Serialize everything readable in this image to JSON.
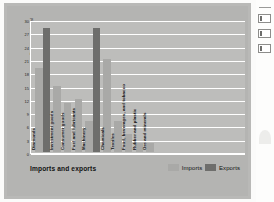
{
  "chart_data": {
    "type": "bar",
    "title": "Imports and exports",
    "xlabel": "",
    "ylabel": "Percentage of total",
    "ylim": [
      0,
      30
    ],
    "grid": true,
    "legend_position": "bottom-right",
    "yticks": [
      "0",
      "3",
      "6",
      "9",
      "12",
      "15",
      "18",
      "21",
      "24",
      "27",
      "30"
    ],
    "categories": [
      "Diamonds",
      "Investment goods",
      "Consumer goods",
      "Fuel and lubricants",
      "Machinery",
      "Chemicals",
      "Textiles",
      "Food, beverages, and tobacco",
      "Rubber and plastic",
      "Ore and minerals"
    ],
    "series": [
      {
        "name": "Imports",
        "color": "#a9a9a7",
        "values": [
          19,
          0,
          15,
          11,
          12,
          0,
          0,
          7,
          4,
          2
        ]
      },
      {
        "name": "Exports",
        "color": "#6e6e6c",
        "values": [
          28,
          0,
          0,
          0,
          7,
          28,
          21,
          7,
          2,
          2
        ]
      }
    ],
    "groups": [
      {
        "category": "Diamonds",
        "imports": 19,
        "exports": 28
      },
      {
        "category": "Investment goods",
        "imports": 15,
        "exports": null
      },
      {
        "category": "Consumer goods",
        "imports": 11,
        "exports": null
      },
      {
        "category": "Fuel and lubricants",
        "imports": 12,
        "exports": null
      },
      {
        "category": "Machinery",
        "imports": 7,
        "exports": 28
      },
      {
        "category": "Chemicals",
        "imports": 21,
        "exports": null
      },
      {
        "category": "Textiles",
        "imports": 7,
        "exports": null
      },
      {
        "category": "Food, beverages, and tobacco",
        "imports": 4,
        "exports": null
      },
      {
        "category": "Rubber and plastic",
        "imports": 2,
        "exports": null
      },
      {
        "category": "Ore and minerals",
        "imports": 2,
        "exports": null
      }
    ]
  },
  "legend": {
    "imports_label": "Imports",
    "exports_label": "Exports"
  },
  "colors": {
    "imports": "#a9a9a7",
    "exports": "#6e6e6c",
    "card": "#b9b9b7",
    "plot": "#bdbdbb",
    "gridline": "#ffffff"
  }
}
